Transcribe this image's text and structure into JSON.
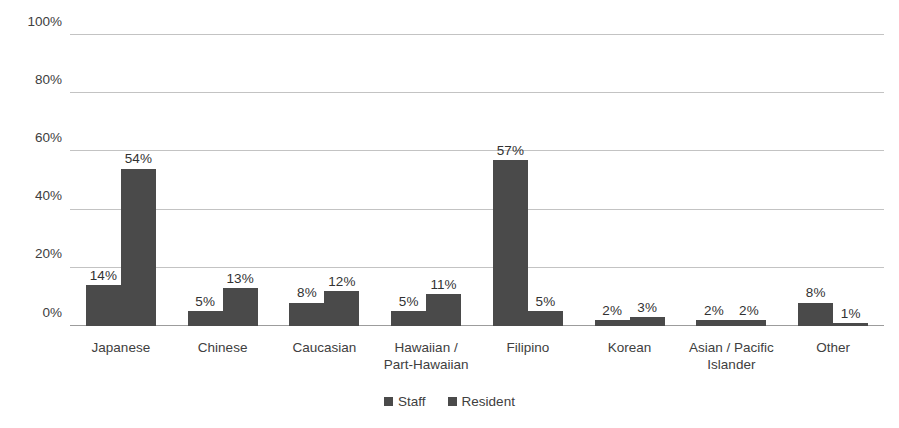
{
  "chart_data": {
    "type": "bar",
    "title": "",
    "subtitle": "",
    "xlabel": "",
    "ylabel": "",
    "ylim": [
      0,
      100
    ],
    "y_ticks": [
      "0%",
      "20%",
      "40%",
      "60%",
      "80%",
      "100%"
    ],
    "y_tick_values": [
      0,
      20,
      40,
      60,
      80,
      100
    ],
    "grid": true,
    "legend_position": "bottom-center",
    "value_suffix": "%",
    "categories": [
      "Japanese",
      "Chinese",
      "Caucasian",
      "Hawaiian /\nPart-Hawaiian",
      "Filipino",
      "Korean",
      "Asian / Pacific\nIslander",
      "Other"
    ],
    "series": [
      {
        "name": "Staff",
        "color": "#4a4a4a",
        "values": [
          14,
          5,
          8,
          5,
          57,
          2,
          2,
          8
        ],
        "labels": [
          "14%",
          "5%",
          "8%",
          "5%",
          "57%",
          "2%",
          "2%",
          "8%"
        ]
      },
      {
        "name": "Resident",
        "color": "#4a4a4a",
        "values": [
          54,
          13,
          12,
          11,
          5,
          3,
          2,
          1
        ],
        "labels": [
          "54%",
          "13%",
          "12%",
          "11%",
          "5%",
          "3%",
          "2%",
          "1%"
        ]
      }
    ]
  },
  "colors": {
    "bar": "#4a4a4a",
    "gridline": "#c3c3c3",
    "axis": "#9c9c9c",
    "text": "#404040",
    "background": "#ffffff"
  }
}
